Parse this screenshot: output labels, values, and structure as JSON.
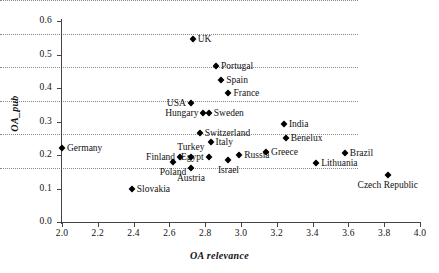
{
  "chart_data": {
    "type": "scatter",
    "title": "",
    "xlabel": "OA relevance",
    "ylabel": "OA_pub",
    "xlim": [
      2.0,
      4.0
    ],
    "ylim": [
      0.0,
      0.6
    ],
    "grid": true,
    "legend": "none",
    "xticks": [
      "2.0",
      "2.2",
      "2.4",
      "2.6",
      "2.8",
      "3.0",
      "3.2",
      "3.4",
      "3.6",
      "3.8",
      "4.0"
    ],
    "yticks": [
      "0.0",
      "0.1",
      "0.2",
      "0.3",
      "0.4",
      "0.5",
      "0.6"
    ],
    "marker": "filled-diamond",
    "marker_color": "#000000",
    "points": [
      {
        "label": "Germany",
        "x": 2.0,
        "y": 0.222,
        "label_pos": "right"
      },
      {
        "label": "Slovakia",
        "x": 2.39,
        "y": 0.098,
        "label_pos": "right"
      },
      {
        "label": "UK",
        "x": 2.73,
        "y": 0.547,
        "label_pos": "right"
      },
      {
        "label": "USA",
        "x": 2.72,
        "y": 0.355,
        "label_pos": "left"
      },
      {
        "label": "Hungary",
        "x": 2.79,
        "y": 0.325,
        "label_pos": "left"
      },
      {
        "label": "Sweden",
        "x": 2.82,
        "y": 0.325,
        "label_pos": "right"
      },
      {
        "label": "Switzerland",
        "x": 2.77,
        "y": 0.266,
        "label_pos": "right"
      },
      {
        "label": "Italy",
        "x": 2.83,
        "y": 0.239,
        "label_pos": "right"
      },
      {
        "label": "Turkey",
        "x": 2.72,
        "y": 0.194,
        "label_pos": "above"
      },
      {
        "label": "Finland",
        "x": 2.66,
        "y": 0.194,
        "label_pos": "left"
      },
      {
        "label": "Poland",
        "x": 2.62,
        "y": 0.179,
        "label_pos": "below"
      },
      {
        "label": "Egypt",
        "x": 2.82,
        "y": 0.194,
        "label_pos": "left"
      },
      {
        "label": "Austria",
        "x": 2.72,
        "y": 0.161,
        "label_pos": "below"
      },
      {
        "label": "Israel",
        "x": 2.93,
        "y": 0.185,
        "label_pos": "below"
      },
      {
        "label": "Russia",
        "x": 2.99,
        "y": 0.2,
        "label_pos": "right"
      },
      {
        "label": "Portugal",
        "x": 2.86,
        "y": 0.466,
        "label_pos": "right"
      },
      {
        "label": "Spain",
        "x": 2.89,
        "y": 0.424,
        "label_pos": "right"
      },
      {
        "label": "France",
        "x": 2.93,
        "y": 0.385,
        "label_pos": "right"
      },
      {
        "label": "India",
        "x": 3.24,
        "y": 0.293,
        "label_pos": "right"
      },
      {
        "label": "Benelux",
        "x": 3.25,
        "y": 0.251,
        "label_pos": "right"
      },
      {
        "label": "Greece",
        "x": 3.14,
        "y": 0.209,
        "label_pos": "right"
      },
      {
        "label": "Brazil",
        "x": 3.58,
        "y": 0.206,
        "label_pos": "right"
      },
      {
        "label": "Lithuania",
        "x": 3.42,
        "y": 0.176,
        "label_pos": "right"
      },
      {
        "label": "Czech Republic",
        "x": 3.82,
        "y": 0.14,
        "label_pos": "below"
      }
    ]
  }
}
